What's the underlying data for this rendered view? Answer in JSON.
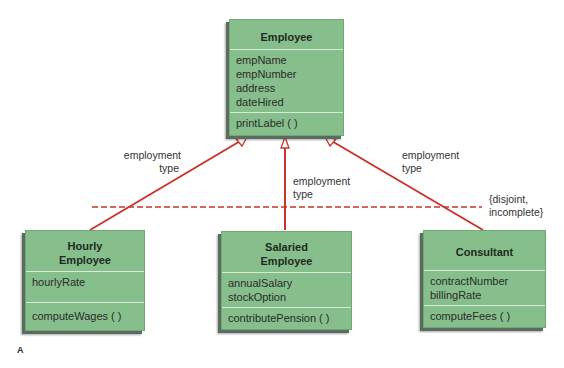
{
  "diagram": {
    "superclass": {
      "name": "Employee",
      "attributes": [
        "empName",
        "empNumber",
        "address",
        "dateHired"
      ],
      "operations": [
        "printLabel ( )"
      ]
    },
    "subclasses": [
      {
        "name_line1": "Hourly",
        "name_line2": "Employee",
        "attributes": [
          "hourlyRate"
        ],
        "operations": [
          "computeWages ( )"
        ]
      },
      {
        "name_line1": "Salaried",
        "name_line2": "Employee",
        "attributes": [
          "annualSalary",
          "stockOption"
        ],
        "operations": [
          "contributePension ( )"
        ]
      },
      {
        "name_line1": "Consultant",
        "name_line2": "",
        "attributes": [
          "contractNumber",
          "billingRate"
        ],
        "operations": [
          "computeFees ( )"
        ]
      }
    ],
    "discriminator_labels": [
      {
        "line1": "employment",
        "line2": "type"
      },
      {
        "line1": "employment",
        "line2": "type"
      },
      {
        "line1": "employment",
        "line2": "type"
      }
    ],
    "constraint": {
      "line1": "{disjoint,",
      "line2": "incomplete}"
    },
    "figure_label": "A",
    "colors": {
      "box_fill": "#86bf8c",
      "line": "#c0392b",
      "divider": "#d6ead8"
    }
  }
}
